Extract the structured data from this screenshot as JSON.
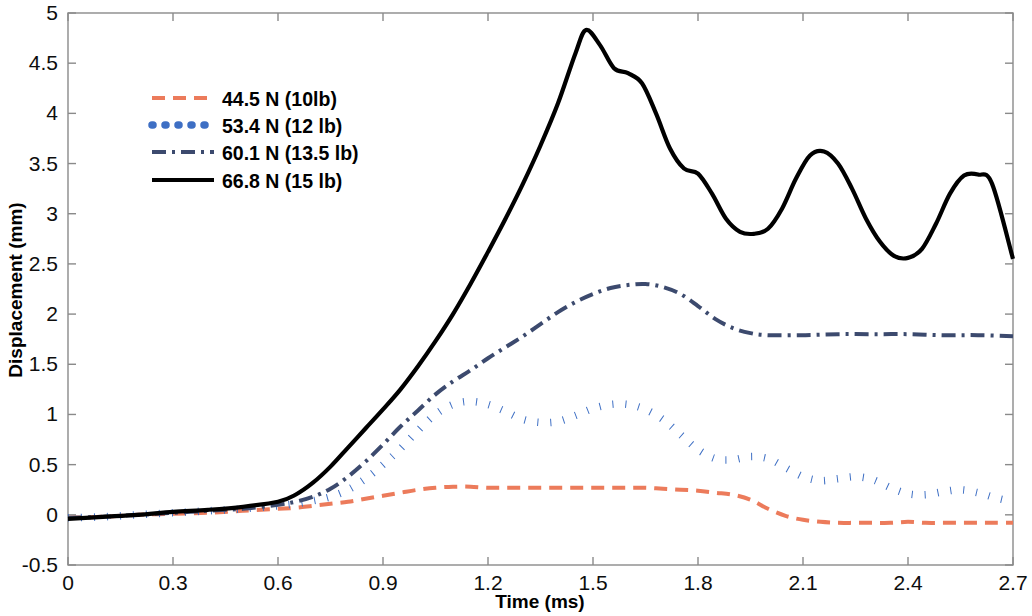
{
  "chart_data": {
    "type": "line",
    "title": "",
    "xlabel": "Time (ms)",
    "ylabel": "Displacement (mm)",
    "xlim": [
      0,
      2.7
    ],
    "ylim": [
      -0.5,
      5
    ],
    "xticks": [
      "0",
      "0.3",
      "0.6",
      "0.9",
      "1.2",
      "1.5",
      "1.8",
      "2.1",
      "2.4",
      "2.7"
    ],
    "xtick_values": [
      0,
      0.3,
      0.6,
      0.9,
      1.2,
      1.5,
      1.8,
      2.1,
      2.4,
      2.7
    ],
    "yticks": [
      "-0.5",
      "0",
      "0.5",
      "1",
      "1.5",
      "2",
      "2.5",
      "3",
      "3.5",
      "4",
      "4.5",
      "5"
    ],
    "ytick_values": [
      -0.5,
      0,
      0.5,
      1,
      1.5,
      2,
      2.5,
      3,
      3.5,
      4,
      4.5,
      5
    ],
    "grid": false,
    "legend_position": "upper-left",
    "series": [
      {
        "name": "44.5 N (10lb)",
        "color": "#EC7B5B",
        "style": "dashed",
        "width": 4.0,
        "dasharray": "13,8",
        "x": [
          0,
          0.1,
          0.2,
          0.3,
          0.4,
          0.5,
          0.6,
          0.65,
          0.7,
          0.75,
          0.8,
          0.85,
          0.9,
          0.95,
          1.0,
          1.05,
          1.1,
          1.15,
          1.2,
          1.25,
          1.3,
          1.35,
          1.4,
          1.45,
          1.5,
          1.55,
          1.6,
          1.65,
          1.7,
          1.75,
          1.8,
          1.85,
          1.9,
          1.95,
          2.0,
          2.05,
          2.1,
          2.15,
          2.2,
          2.25,
          2.3,
          2.35,
          2.4,
          2.45,
          2.5,
          2.55,
          2.6,
          2.65,
          2.7
        ],
        "y": [
          -0.03,
          -0.02,
          0.0,
          0.01,
          0.02,
          0.04,
          0.06,
          0.07,
          0.09,
          0.11,
          0.13,
          0.16,
          0.19,
          0.22,
          0.25,
          0.27,
          0.28,
          0.28,
          0.27,
          0.27,
          0.27,
          0.27,
          0.27,
          0.27,
          0.27,
          0.27,
          0.27,
          0.27,
          0.26,
          0.25,
          0.24,
          0.22,
          0.2,
          0.15,
          0.06,
          -0.01,
          -0.05,
          -0.07,
          -0.08,
          -0.08,
          -0.08,
          -0.08,
          -0.07,
          -0.08,
          -0.08,
          -0.08,
          -0.08,
          -0.08,
          -0.08
        ]
      },
      {
        "name": "53.4 N (12 lb)",
        "color": "#3E6FC4",
        "style": "dotted",
        "width": 7.5,
        "dasharray": "1,12",
        "x": [
          0,
          0.1,
          0.2,
          0.3,
          0.4,
          0.5,
          0.6,
          0.65,
          0.7,
          0.75,
          0.8,
          0.85,
          0.9,
          0.95,
          1.0,
          1.05,
          1.1,
          1.15,
          1.2,
          1.25,
          1.3,
          1.35,
          1.4,
          1.45,
          1.5,
          1.55,
          1.6,
          1.65,
          1.7,
          1.75,
          1.8,
          1.85,
          1.9,
          1.95,
          2.0,
          2.05,
          2.1,
          2.15,
          2.2,
          2.25,
          2.3,
          2.35,
          2.4,
          2.45,
          2.5,
          2.55,
          2.6,
          2.65,
          2.7
        ],
        "y": [
          -0.03,
          -0.02,
          0.0,
          0.02,
          0.04,
          0.06,
          0.09,
          0.11,
          0.14,
          0.18,
          0.25,
          0.36,
          0.5,
          0.66,
          0.84,
          1.0,
          1.1,
          1.13,
          1.1,
          1.03,
          0.95,
          0.92,
          0.93,
          0.99,
          1.06,
          1.1,
          1.1,
          1.05,
          0.95,
          0.8,
          0.65,
          0.56,
          0.55,
          0.58,
          0.56,
          0.47,
          0.38,
          0.34,
          0.36,
          0.38,
          0.35,
          0.27,
          0.21,
          0.2,
          0.23,
          0.25,
          0.22,
          0.17,
          0.13
        ]
      },
      {
        "name": "60.1 N (13.5 lb)",
        "color": "#3C4A6E",
        "style": "dashdot",
        "width": 4.0,
        "dasharray": "14,6,3,6",
        "x": [
          0,
          0.1,
          0.2,
          0.3,
          0.4,
          0.5,
          0.6,
          0.65,
          0.7,
          0.75,
          0.8,
          0.85,
          0.9,
          0.95,
          1.0,
          1.05,
          1.1,
          1.15,
          1.2,
          1.25,
          1.3,
          1.35,
          1.4,
          1.45,
          1.5,
          1.55,
          1.6,
          1.65,
          1.7,
          1.75,
          1.8,
          1.85,
          1.9,
          1.95,
          2.0,
          2.1,
          2.2,
          2.3,
          2.4,
          2.5,
          2.6,
          2.7
        ],
        "y": [
          -0.03,
          -0.02,
          0.0,
          0.02,
          0.04,
          0.06,
          0.1,
          0.13,
          0.18,
          0.26,
          0.38,
          0.53,
          0.7,
          0.88,
          1.04,
          1.2,
          1.33,
          1.44,
          1.56,
          1.67,
          1.78,
          1.9,
          2.02,
          2.12,
          2.2,
          2.26,
          2.29,
          2.3,
          2.27,
          2.2,
          2.08,
          1.95,
          1.86,
          1.81,
          1.79,
          1.79,
          1.8,
          1.8,
          1.8,
          1.79,
          1.79,
          1.78
        ]
      },
      {
        "name": "66.8 N (15 lb)",
        "color": "#000000",
        "style": "solid",
        "width": 4.2,
        "dasharray": "",
        "x": [
          0,
          0.1,
          0.2,
          0.3,
          0.4,
          0.5,
          0.6,
          0.65,
          0.7,
          0.75,
          0.8,
          0.85,
          0.9,
          0.95,
          1.0,
          1.05,
          1.1,
          1.15,
          1.2,
          1.25,
          1.3,
          1.35,
          1.4,
          1.45,
          1.48,
          1.52,
          1.56,
          1.6,
          1.64,
          1.68,
          1.72,
          1.76,
          1.8,
          1.84,
          1.88,
          1.92,
          1.96,
          2.0,
          2.04,
          2.08,
          2.12,
          2.16,
          2.2,
          2.24,
          2.28,
          2.32,
          2.36,
          2.4,
          2.44,
          2.48,
          2.52,
          2.56,
          2.6,
          2.64,
          2.7
        ],
        "y": [
          -0.04,
          -0.02,
          0.0,
          0.03,
          0.05,
          0.08,
          0.13,
          0.2,
          0.32,
          0.48,
          0.67,
          0.86,
          1.05,
          1.25,
          1.48,
          1.73,
          2.0,
          2.3,
          2.62,
          2.95,
          3.3,
          3.68,
          4.1,
          4.6,
          4.83,
          4.68,
          4.45,
          4.4,
          4.3,
          4.0,
          3.65,
          3.45,
          3.4,
          3.2,
          2.95,
          2.82,
          2.8,
          2.85,
          3.05,
          3.35,
          3.58,
          3.62,
          3.5,
          3.25,
          2.95,
          2.72,
          2.58,
          2.56,
          2.65,
          2.9,
          3.2,
          3.38,
          3.39,
          3.3,
          2.55
        ]
      }
    ]
  },
  "legend": {
    "entries": [
      {
        "label": "44.5 N (10lb)"
      },
      {
        "label": "53.4 N (12 lb)"
      },
      {
        "label": "60.1 N (13.5 lb)"
      },
      {
        "label": "66.8 N (15 lb)"
      }
    ]
  }
}
